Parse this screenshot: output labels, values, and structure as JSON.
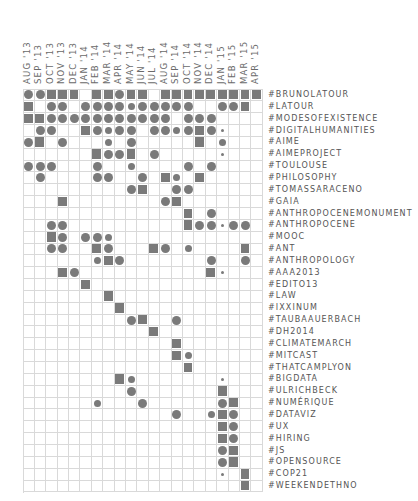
{
  "chart_data": {
    "type": "heatmap",
    "title": "",
    "xlabel": "",
    "ylabel": "",
    "grid": true,
    "legend": "none",
    "mark_color": "#7a7a7a",
    "grid_color": "#d9d9d9",
    "mark_legend": {
      "S": "square (highest)",
      "C": "large circle",
      "c": "small circle",
      "d": "dot (lowest)",
      ".": "empty"
    },
    "columns": [
      "AUG '13",
      "SEP '13",
      "OCT '13",
      "NOV '13",
      "DEC '13",
      "JAN '14",
      "FEB '14",
      "MAR '14",
      "APR '14",
      "MAY '14",
      "JUN '14",
      "JUL '14",
      "AUG '14",
      "SEP '14",
      "OCT '14",
      "NOV '14",
      "DEC '14",
      "JAN '15",
      "FEB '15",
      "MAR '15",
      "APR '15"
    ],
    "rows": [
      {
        "label": "#BRUNOLATOUR",
        "cells": "CCSSS.SSCSS.SSSSSSSSS"
      },
      {
        "label": "#LATOUR",
        "cells": "S.CC.CCCCcCCCCC..CCS.S"
      },
      {
        "label": "#MODESOFEXISTENCE",
        "cells": "SSCCCCCCCCCCC.CCC...."
      },
      {
        "label": "#DIGITALHUMANITIES",
        "cells": ".CC..SCcCC.CCcCSCd..."
      },
      {
        "label": "#AIME",
        "cells": "CS.C...c.C.....S.c..."
      },
      {
        "label": "#AIMEPROJECT",
        "cells": "......SCCS.C.....d..."
      },
      {
        "label": "#TOULOUSE",
        "cells": "CCC...C..c....C.C...."
      },
      {
        "label": "#PHILOSOPHY",
        "cells": ".C....CC..C.Sc.S....."
      },
      {
        "label": "#TOMASSARACENO",
        "cells": ".........CS..CC......"
      },
      {
        "label": "#GAIA",
        "cells": "...S........CS......."
      },
      {
        "label": "#ANTHROPOCENEMONUMENT",
        "cells": "..............S.C...."
      },
      {
        "label": "#ANTHROPOCENE",
        "cells": "..CC..........SCCdCC."
      },
      {
        "label": "#MOOC",
        "cells": "..SC.CCc............."
      },
      {
        "label": "#ANT",
        "cells": "..CC..SC...SC.c....S."
      },
      {
        "label": "#ANTHROPOLOGY",
        "cells": "......cSC.......C..C."
      },
      {
        "label": "#AAA2013",
        "cells": "...SC...........Sd..."
      },
      {
        "label": "#EDITO13",
        "cells": ".....S..............."
      },
      {
        "label": "#LAW",
        "cells": ".......S............."
      },
      {
        "label": "#IXXINUM",
        "cells": "........S............"
      },
      {
        "label": "#TAUBAAUERBACH",
        "cells": ".........CS..C......."
      },
      {
        "label": "#DH2014",
        "cells": "...........S........."
      },
      {
        "label": "#CLIMATEMARCH",
        "cells": ".............S......."
      },
      {
        "label": "#MITCAST",
        "cells": ".............Sc......"
      },
      {
        "label": "#THATCAMPLYON",
        "cells": "..............S......"
      },
      {
        "label": "#BIGDATA",
        "cells": "........Sc.......d..."
      },
      {
        "label": "#ULRICHBECK",
        "cells": ".........C.......S..."
      },
      {
        "label": "#NUMÉRIQUE",
        "cells": "......c...C......CS.."
      },
      {
        "label": "#DATAVIZ",
        "cells": ".............C..cSC.."
      },
      {
        "label": "#UX",
        "cells": ".................SC.."
      },
      {
        "label": "#HIRING",
        "cells": ".................SC.."
      },
      {
        "label": "#JS",
        "cells": ".................CS.."
      },
      {
        "label": "#OPENSOURCE",
        "cells": ".................CS.."
      },
      {
        "label": "#COP21",
        "cells": ".................d.S."
      },
      {
        "label": "#WEEKENDETHNO",
        "cells": "...................S."
      }
    ]
  }
}
